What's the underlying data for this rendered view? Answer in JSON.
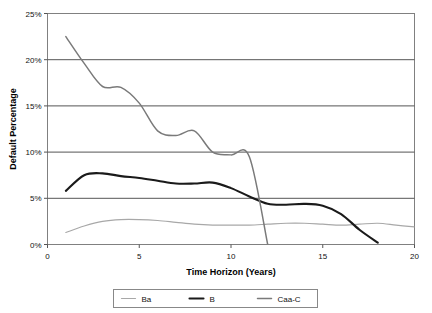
{
  "chart_data": {
    "type": "line",
    "title": "",
    "xlabel": "Time Horizon (Years)",
    "ylabel": "Default Percentage",
    "xlim": [
      0,
      20
    ],
    "ylim": [
      0,
      25
    ],
    "xticks": [
      0,
      5,
      10,
      15,
      20
    ],
    "xtick_labels": [
      "0",
      "5",
      "10",
      "15",
      "20"
    ],
    "yticks": [
      0,
      5,
      10,
      15,
      20,
      25
    ],
    "ytick_labels": [
      "0%",
      "5%",
      "10%",
      "15%",
      "20%",
      "25%"
    ],
    "grid": "horizontal",
    "legend_position": "bottom",
    "x": [
      1,
      2,
      3,
      4,
      5,
      6,
      7,
      8,
      9,
      10,
      11,
      12,
      13,
      14,
      15,
      16,
      17,
      18,
      19,
      20
    ],
    "series": [
      {
        "name": "Ba",
        "color": "#a8a8a8",
        "width": 1.2,
        "values": [
          1.3,
          2.0,
          2.5,
          2.7,
          2.7,
          2.6,
          2.4,
          2.2,
          2.1,
          2.1,
          2.1,
          2.2,
          2.3,
          2.3,
          2.2,
          2.1,
          2.2,
          2.3,
          2.1,
          1.9
        ]
      },
      {
        "name": "B",
        "color": "#1a1a1a",
        "width": 2.1,
        "values": [
          5.8,
          7.5,
          7.7,
          7.4,
          7.2,
          6.9,
          6.6,
          6.6,
          6.7,
          6.1,
          5.2,
          4.4,
          4.3,
          4.4,
          4.2,
          3.3,
          1.6,
          0.2,
          null,
          null
        ]
      },
      {
        "name": "Caa-C",
        "color": "#7a7a7a",
        "width": 1.5,
        "values": [
          22.5,
          19.6,
          17.1,
          17.0,
          15.3,
          12.3,
          11.8,
          12.3,
          10.0,
          9.7,
          9.5,
          0.0,
          null,
          null,
          null,
          null,
          null,
          null,
          null,
          null
        ]
      }
    ],
    "annotations": {
      "caa_c_note": "Caa-C series terminates after year 12 dropping to 0%",
      "b_note": "B series terminates after year 18 reaching 0%"
    }
  },
  "legend": {
    "entries": [
      {
        "label": "Ba",
        "color": "#a8a8a8"
      },
      {
        "label": "B",
        "color": "#1a1a1a"
      },
      {
        "label": "Caa-C",
        "color": "#7a7a7a"
      }
    ]
  },
  "axes": {
    "y_title": "Default Percentage",
    "x_title": "Time Horizon (Years)",
    "y_labels": [
      "25%",
      "20%",
      "15%",
      "10%",
      "5%",
      "0%"
    ],
    "x_labels": [
      "0",
      "5",
      "10",
      "15",
      "20"
    ]
  },
  "colors": {
    "plot_border": "#808080",
    "gridline": "#555555",
    "axis_text": "#111111",
    "background": "#ffffff"
  }
}
